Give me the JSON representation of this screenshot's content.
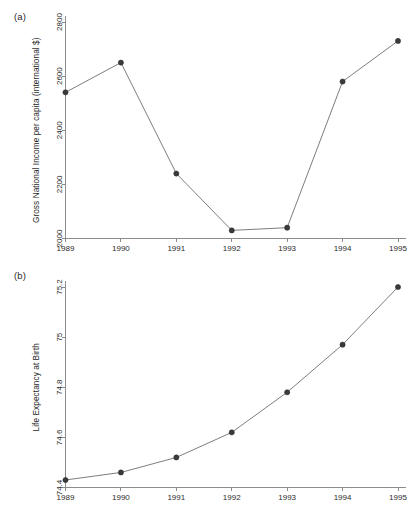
{
  "figure": {
    "background": "#ffffff",
    "line_color": "#6e6e6e",
    "marker_color": "#3a3a3a",
    "axis_color": "#8c8c8c"
  },
  "panels": [
    {
      "label": "(a)"
    },
    {
      "label": "(b)"
    }
  ],
  "chart_data": [
    {
      "type": "line",
      "panel": "(a)",
      "title": "",
      "xlabel": "",
      "ylabel": "Gross National Income per capita (international $)",
      "categories": [
        "1989",
        "1990",
        "1991",
        "1992",
        "1993",
        "1994",
        "1995"
      ],
      "x": [
        1989,
        1990,
        1991,
        1992,
        1993,
        1994,
        1995
      ],
      "values": [
        2540,
        2650,
        2240,
        2030,
        2040,
        2580,
        2730
      ],
      "ylim": [
        2000,
        2800
      ],
      "yticks": [
        2000,
        2200,
        2400,
        2600,
        2800
      ],
      "ytick_labels": [
        "2000",
        "2200",
        "2400",
        "2600",
        "2800"
      ],
      "xtick_labels": [
        "1989",
        "1990",
        "1991",
        "1992",
        "1993",
        "1994",
        "1995"
      ],
      "grid": false,
      "legend": "none",
      "marker": "filled-circle"
    },
    {
      "type": "line",
      "panel": "(b)",
      "title": "",
      "xlabel": "",
      "ylabel": "Life Expectancy at Birth",
      "categories": [
        "1989",
        "1990",
        "1991",
        "1992",
        "1993",
        "1994",
        "1995"
      ],
      "x": [
        1989,
        1990,
        1991,
        1992,
        1993,
        1994,
        1995
      ],
      "values": [
        74.43,
        74.46,
        74.52,
        74.62,
        74.78,
        74.97,
        75.2
      ],
      "ylim": [
        74.4,
        75.2
      ],
      "yticks": [
        74.4,
        74.6,
        74.8,
        75,
        75.2
      ],
      "ytick_labels": [
        "74.4",
        "74.6",
        "74.8",
        "75",
        "75.2"
      ],
      "xtick_labels": [
        "1989",
        "1990",
        "1991",
        "1992",
        "1993",
        "1994",
        "1995"
      ],
      "grid": false,
      "legend": "none",
      "marker": "filled-circle"
    }
  ]
}
